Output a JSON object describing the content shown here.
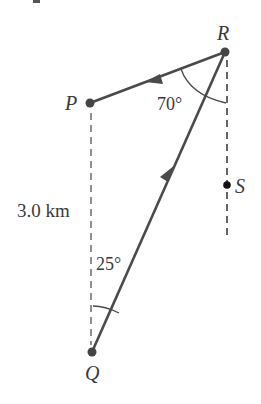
{
  "figure": {
    "points": {
      "P": {
        "label": "P",
        "x": 90,
        "y": 103
      },
      "Q": {
        "label": "Q",
        "x": 92,
        "y": 352
      },
      "R": {
        "label": "R",
        "x": 225,
        "y": 52
      },
      "S": {
        "label": "S",
        "x": 227,
        "y": 185
      }
    },
    "angles": {
      "at_R": "70°",
      "at_Q": "25°"
    },
    "distance_label": "3.0 km",
    "colors": {
      "line": "#4a4a4a",
      "dash": "#555555",
      "text": "#3a3a3a"
    }
  }
}
